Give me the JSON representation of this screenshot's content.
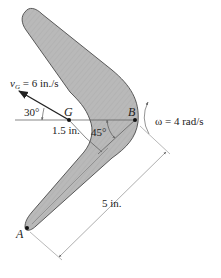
{
  "figure": {
    "type": "rigid-body kinematics diagram",
    "object": "boomerang",
    "colors": {
      "body_fill": "#b8b8b8",
      "body_stroke": "#4a4a4a",
      "line": "#555555",
      "dimension_line": "#777777",
      "arrow": "#222222"
    }
  },
  "labels": {
    "velocity_symbol": "v",
    "velocity_sub": "G",
    "velocity_value": " = 6 in./s",
    "angle_30": "30°",
    "point_g": "G",
    "point_b": "B",
    "point_a": "A",
    "dist_gb": "1.5 in.",
    "angle_45": "45°",
    "omega": "ω = 4 rad/s",
    "dist_ab": "5 in."
  },
  "quantities": {
    "v_G_in_per_s": 6,
    "v_G_angle_deg": 30,
    "omega_rad_per_s": 4,
    "GB_in": 1.5,
    "AB_in": 5,
    "arm_angle_deg": 45
  }
}
